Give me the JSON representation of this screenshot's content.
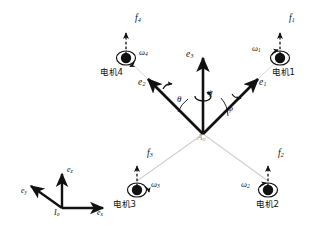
{
  "figure": {
    "type": "diagram",
    "background_color": "#ffffff",
    "arm_color_front": "#111111",
    "arm_color_rear": "#c9c9c9",
    "hub_color": "#111111"
  },
  "body_frame": {
    "origin_label": "A",
    "origin_subscript": "o",
    "vertical_axis": {
      "label": "e",
      "subscript": "3"
    },
    "arms": [
      {
        "label": "e",
        "subscript": "1",
        "direction": "upper-right",
        "motor": "motor-1"
      },
      {
        "label": "e",
        "subscript": "2",
        "direction": "upper-left",
        "motor": "motor-4"
      }
    ],
    "angles": [
      {
        "name": "phi",
        "symbol": "φ",
        "role": "roll",
        "position": "right"
      },
      {
        "name": "theta",
        "symbol": "θ",
        "role": "pitch",
        "position": "left"
      },
      {
        "name": "psi",
        "symbol": "ψ",
        "role": "yaw",
        "position": "center"
      }
    ]
  },
  "inertial_frame": {
    "origin_label": "I",
    "origin_subscript": "o",
    "axes": [
      {
        "label": "e",
        "subscript": "x",
        "direction": "right"
      },
      {
        "label": "e",
        "subscript": "y",
        "direction": "upper-left"
      },
      {
        "label": "e",
        "subscript": "z",
        "direction": "up"
      }
    ]
  },
  "motors": [
    {
      "id": "motor-1",
      "name": "电机1",
      "force_label": "f",
      "force_subscript": "1",
      "omega_label": "ω",
      "omega_subscript": "1",
      "position": "upper-right",
      "spin": "counterclockwise"
    },
    {
      "id": "motor-2",
      "name": "电机2",
      "force_label": "f",
      "force_subscript": "2",
      "omega_label": "ω",
      "omega_subscript": "2",
      "position": "lower-right",
      "spin": "clockwise"
    },
    {
      "id": "motor-3",
      "name": "电机3",
      "force_label": "f",
      "force_subscript": "3",
      "omega_label": "ω",
      "omega_subscript": "3",
      "position": "lower-left",
      "spin": "counterclockwise"
    },
    {
      "id": "motor-4",
      "name": "电机4",
      "force_label": "f",
      "force_subscript": "4",
      "omega_label": "ω",
      "omega_subscript": "4",
      "position": "upper-left",
      "spin": "clockwise"
    }
  ]
}
